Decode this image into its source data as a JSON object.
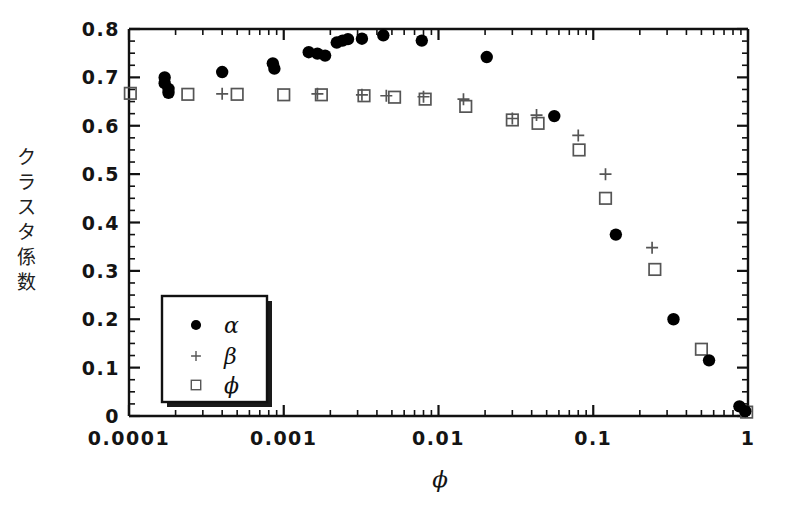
{
  "figure": {
    "background": "#ffffff",
    "ink": "#111111",
    "width": 788,
    "height": 510
  },
  "axis_labels": {
    "x_title": "ϕ",
    "y_title": "クラスタ係数",
    "y_title_chars": [
      "ク",
      "ラ",
      "ス",
      "タ",
      "係",
      "数"
    ]
  },
  "x_ticks": [
    {
      "value": 0.0001,
      "label": "0.0001"
    },
    {
      "value": 0.001,
      "label": "0.001"
    },
    {
      "value": 0.01,
      "label": "0.01"
    },
    {
      "value": 0.1,
      "label": "0.1"
    },
    {
      "value": 1,
      "label": "1"
    }
  ],
  "y_ticks": [
    {
      "value": 0,
      "label": "0"
    },
    {
      "value": 0.1,
      "label": "0.1"
    },
    {
      "value": 0.2,
      "label": "0.2"
    },
    {
      "value": 0.3,
      "label": "0.3"
    },
    {
      "value": 0.4,
      "label": "0.4"
    },
    {
      "value": 0.5,
      "label": "0.5"
    },
    {
      "value": 0.6,
      "label": "0.6"
    },
    {
      "value": 0.7,
      "label": "0.7"
    },
    {
      "value": 0.8,
      "label": "0.8"
    }
  ],
  "legend": {
    "entries": [
      {
        "marker": "filled-circle",
        "label": "α"
      },
      {
        "marker": "plus",
        "label": "β"
      },
      {
        "marker": "open-square",
        "label": "ϕ"
      }
    ]
  },
  "chart_data": {
    "type": "scatter",
    "title": "",
    "xlabel": "ϕ",
    "ylabel": "クラスタ係数",
    "xscale": "log",
    "yscale": "linear",
    "xlim": [
      0.0001,
      1
    ],
    "ylim": [
      0,
      0.8
    ],
    "grid": false,
    "legend_position": "lower-left-inside",
    "series": [
      {
        "name": "α",
        "marker": "filled-circle",
        "color": "#000000",
        "points": [
          [
            0.00017,
            0.7
          ],
          [
            0.00017,
            0.688
          ],
          [
            0.00018,
            0.676
          ],
          [
            0.00018,
            0.668
          ],
          [
            0.0004,
            0.711
          ],
          [
            0.00085,
            0.729
          ],
          [
            0.00087,
            0.718
          ],
          [
            0.00145,
            0.752
          ],
          [
            0.00165,
            0.749
          ],
          [
            0.00185,
            0.745
          ],
          [
            0.0022,
            0.772
          ],
          [
            0.0024,
            0.776
          ],
          [
            0.0026,
            0.779
          ],
          [
            0.0032,
            0.78
          ],
          [
            0.0044,
            0.787
          ],
          [
            0.0078,
            0.776
          ],
          [
            0.0205,
            0.742
          ],
          [
            0.056,
            0.62
          ],
          [
            0.14,
            0.375
          ],
          [
            0.33,
            0.2
          ],
          [
            0.56,
            0.115
          ],
          [
            0.88,
            0.02
          ],
          [
            0.96,
            0.01
          ]
        ]
      },
      {
        "name": "β",
        "marker": "plus",
        "color": "#555555",
        "points": [
          [
            0.0004,
            0.666
          ],
          [
            0.00165,
            0.666
          ],
          [
            0.0032,
            0.664
          ],
          [
            0.0046,
            0.662
          ],
          [
            0.008,
            0.66
          ],
          [
            0.0145,
            0.655
          ],
          [
            0.03,
            0.615
          ],
          [
            0.043,
            0.622
          ],
          [
            0.08,
            0.58
          ],
          [
            0.12,
            0.5
          ],
          [
            0.24,
            0.348
          ]
        ]
      },
      {
        "name": "ϕ",
        "marker": "open-square",
        "color": "#555555",
        "points": [
          [
            0.000102,
            0.667
          ],
          [
            0.00024,
            0.665
          ],
          [
            0.0005,
            0.665
          ],
          [
            0.001,
            0.664
          ],
          [
            0.00175,
            0.664
          ],
          [
            0.0033,
            0.662
          ],
          [
            0.0052,
            0.659
          ],
          [
            0.0082,
            0.655
          ],
          [
            0.015,
            0.64
          ],
          [
            0.03,
            0.612
          ],
          [
            0.044,
            0.605
          ],
          [
            0.081,
            0.55
          ],
          [
            0.12,
            0.45
          ],
          [
            0.25,
            0.303
          ],
          [
            0.5,
            0.138
          ],
          [
            0.98,
            0.008
          ]
        ]
      }
    ]
  }
}
